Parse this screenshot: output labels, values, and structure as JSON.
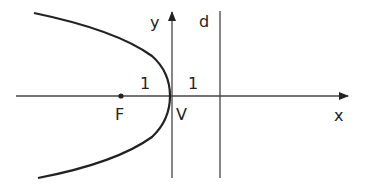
{
  "diagram": {
    "type": "parabola-focus-directrix",
    "labels": {
      "x_axis": "x",
      "y_axis": "y",
      "directrix": "d",
      "focus": "F",
      "vertex": "V",
      "focus_distance": "1",
      "directrix_distance": "1"
    },
    "colors": {
      "stroke": "#222222",
      "axis": "#444444",
      "background": "#ffffff"
    }
  }
}
